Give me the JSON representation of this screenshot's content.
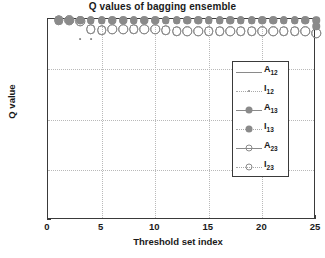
{
  "chart_data": {
    "type": "scatter",
    "title": "Q values of bagging ensemble",
    "xlabel": "Threshold set index",
    "ylabel": "Q value",
    "xlim": [
      0,
      25
    ],
    "ylim": [
      -1,
      1
    ],
    "xticks": [
      "0",
      "5",
      "10",
      "15",
      "20",
      "25"
    ],
    "xtick_values": [
      0,
      5,
      10,
      15,
      20,
      25
    ],
    "yticks": [
      "1",
      "0.5",
      "0",
      "-0.5",
      "-1"
    ],
    "ytick_values": [
      1,
      0.5,
      0,
      -0.5,
      -1
    ],
    "grid": true,
    "legend_position": "center-right",
    "marker_color": "#8a8a8a",
    "x": [
      1,
      2,
      3,
      4,
      5,
      6,
      7,
      8,
      9,
      10,
      11,
      12,
      13,
      14,
      15,
      16,
      17,
      18,
      19,
      20,
      21,
      22,
      23,
      24,
      25
    ],
    "series": [
      {
        "name": "A12",
        "label": "A",
        "sub": "12",
        "style": "line",
        "marker": "none",
        "values": [
          0.99,
          0.99,
          0.99,
          0.99,
          0.99,
          0.99,
          0.99,
          0.99,
          0.99,
          0.99,
          0.99,
          0.99,
          0.99,
          0.99,
          0.99,
          0.99,
          0.99,
          0.99,
          0.99,
          0.99,
          0.99,
          0.99,
          0.99,
          0.99,
          0.99
        ]
      },
      {
        "name": "I12",
        "label": "I",
        "sub": "12",
        "style": "dotted",
        "marker": "dot",
        "values": [
          0.99,
          0.99,
          0.8,
          0.8,
          0.99,
          0.99,
          0.99,
          0.99,
          0.99,
          0.99,
          0.99,
          0.99,
          0.99,
          0.99,
          0.99,
          0.99,
          0.99,
          0.99,
          0.99,
          0.99,
          0.99,
          0.99,
          0.99,
          0.99,
          0.99
        ]
      },
      {
        "name": "A13",
        "label": "A",
        "sub": "13",
        "style": "line",
        "marker": "filled-circle",
        "values": [
          0.99,
          0.99,
          0.99,
          0.99,
          0.99,
          0.99,
          0.99,
          0.99,
          0.99,
          0.99,
          0.99,
          0.99,
          0.99,
          0.99,
          0.99,
          0.99,
          0.99,
          0.99,
          0.99,
          0.99,
          0.99,
          0.99,
          0.99,
          0.99,
          0.99
        ]
      },
      {
        "name": "I13",
        "label": "I",
        "sub": "13",
        "style": "dotted",
        "marker": "filled-circle",
        "values": [
          0.99,
          0.99,
          0.99,
          0.99,
          0.99,
          0.99,
          0.99,
          0.99,
          0.99,
          0.99,
          0.99,
          0.99,
          0.99,
          0.99,
          0.99,
          0.99,
          0.99,
          0.99,
          0.99,
          0.99,
          0.99,
          0.99,
          0.99,
          0.99,
          0.93
        ]
      },
      {
        "name": "A23",
        "label": "A",
        "sub": "23",
        "style": "line",
        "marker": "open-circle",
        "values": [
          0.99,
          0.99,
          0.98,
          0.9,
          0.89,
          0.9,
          0.9,
          0.9,
          0.9,
          0.9,
          0.89,
          0.88,
          0.88,
          0.88,
          0.88,
          0.88,
          0.88,
          0.88,
          0.88,
          0.88,
          0.88,
          0.88,
          0.88,
          0.88,
          0.86
        ]
      },
      {
        "name": "I23",
        "label": "I",
        "sub": "23",
        "style": "dotted",
        "marker": "open-circle",
        "values": [
          0.99,
          0.99,
          0.98,
          0.9,
          0.89,
          0.9,
          0.9,
          0.9,
          0.9,
          0.9,
          0.89,
          0.88,
          0.88,
          0.88,
          0.88,
          0.88,
          0.88,
          0.88,
          0.88,
          0.88,
          0.88,
          0.88,
          0.88,
          0.88,
          0.86
        ]
      }
    ]
  }
}
